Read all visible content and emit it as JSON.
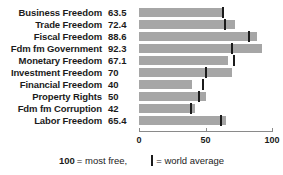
{
  "chart_data": {
    "type": "bar",
    "title": "",
    "xlabel": "",
    "ylabel": "",
    "orientation": "horizontal",
    "xlim": [
      0,
      100
    ],
    "xticks": [
      0,
      50,
      100
    ],
    "xtick_labels": [
      "0",
      "50",
      "100"
    ],
    "grid": false,
    "categories": [
      "Business Freedom",
      "Trade Freedom",
      "Fiscal Freedom",
      "Fdm fm Government",
      "Monetary Freedom",
      "Investment Freedom",
      "Financial Freedom",
      "Property Rights",
      "Fdm fm Corruption",
      "Labor Freedom"
    ],
    "values": [
      63.5,
      72.4,
      88.6,
      92.3,
      67.1,
      70,
      40,
      50,
      42,
      65.4
    ],
    "value_labels": [
      "63.5",
      "72.4",
      "88.6",
      "92.3",
      "67.1",
      "70",
      "50",
      "50",
      "42",
      "65.4"
    ],
    "series": [
      {
        "name": "Score",
        "values": [
          63.5,
          72.4,
          88.6,
          92.3,
          67.1,
          70,
          40,
          50,
          42,
          65.4
        ]
      },
      {
        "name": "World average",
        "marker": "vertical-line",
        "values": [
          63,
          65,
          83,
          70,
          71.5,
          50,
          48,
          45,
          39,
          62
        ]
      }
    ],
    "bar_color": "#a6a6a6",
    "marker_color": "#1b1b1b",
    "legend": {
      "position": "bottom",
      "entries": [
        {
          "text_strong": "100",
          "text": "= most free,"
        },
        {
          "marker": "world-average-marker",
          "text": "= world average"
        }
      ]
    }
  },
  "rows": [
    {
      "label": "Business Freedom",
      "value": "63.5",
      "bar": 63.5,
      "avg": 63.0
    },
    {
      "label": "Trade Freedom",
      "value": "72.4",
      "bar": 72.4,
      "avg": 65.0
    },
    {
      "label": "Fiscal Freedom",
      "value": "88.6",
      "bar": 88.6,
      "avg": 83.0
    },
    {
      "label": "Fdm fm Government",
      "value": "92.3",
      "bar": 92.3,
      "avg": 70.0
    },
    {
      "label": "Monetary Freedom",
      "value": "67.1",
      "bar": 67.1,
      "avg": 71.5
    },
    {
      "label": "Investment Freedom",
      "value": "70",
      "bar": 70.0,
      "avg": 50.0
    },
    {
      "label": "Financial Freedom",
      "value": "40",
      "bar": 40.0,
      "avg": 48.0
    },
    {
      "label": "Property Rights",
      "value": "50",
      "bar": 50.0,
      "avg": 45.0
    },
    {
      "label": "Fdm fm Corruption",
      "value": "42",
      "bar": 42.0,
      "avg": 39.0
    },
    {
      "label": "Labor Freedom",
      "value": "65.4",
      "bar": 65.4,
      "avg": 62.0
    }
  ],
  "axis": {
    "ticks": [
      {
        "value": 0,
        "label": "0"
      },
      {
        "value": 50,
        "label": "50"
      },
      {
        "value": 100,
        "label": "100"
      }
    ]
  },
  "legend": {
    "most_free_number": "100",
    "most_free_text": "= most free,",
    "world_average_text": "= world average"
  }
}
